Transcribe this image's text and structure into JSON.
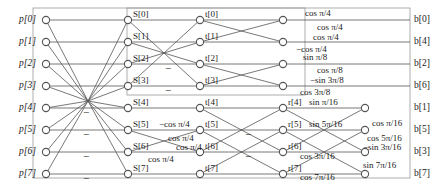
{
  "diagram": {
    "type": "signal-flow-graph",
    "stroke_color": "#555555",
    "node_fill": "#ffffff",
    "text_color": "#1a1a1a",
    "columns": [
      {
        "id": "p",
        "x": 46
      },
      {
        "id": "S",
        "x": 128
      },
      {
        "id": "t",
        "x": 200
      },
      {
        "id": "r",
        "x": 283
      },
      {
        "id": "b",
        "x": 365
      }
    ],
    "rows_y": [
      20,
      42,
      64,
      86,
      108,
      130,
      152,
      174
    ]
  },
  "inputs": {
    "labels": [
      "p[0]",
      "p[1]",
      "p[2]",
      "p[3]",
      "p[4]",
      "p[5]",
      "p[6]",
      "p[7]"
    ]
  },
  "outputs": {
    "labels": [
      "b[0]",
      "b[4]",
      "b[2]",
      "b[6]",
      "b[1]",
      "b[5]",
      "b[3]",
      "b[7]"
    ]
  },
  "stage1_nodes": {
    "labels": [
      "S[0]",
      "S[1]",
      "S[2]",
      "S[3]",
      "S[4]",
      "S[5]",
      "S[6]",
      "S[7]"
    ]
  },
  "stage2_nodes": {
    "labels": [
      "t[0]",
      "t[1]",
      "t[2]",
      "t[3]",
      "t[4]",
      "t[5]",
      "t[6]",
      "t[7]"
    ]
  },
  "stage3_nodes": {
    "labels": [
      "r[4]",
      "r[5]",
      "r[6]",
      "r[7]"
    ]
  },
  "minus_signs": [
    {
      "name": "minus-stage1-row5",
      "x": 83,
      "y": 113
    },
    {
      "name": "minus-stage1-row6",
      "x": 83,
      "y": 135
    },
    {
      "name": "minus-stage1-row7",
      "x": 83,
      "y": 157
    },
    {
      "name": "minus-stage1-row8",
      "x": 83,
      "y": 179
    },
    {
      "name": "minus-stage2-row3",
      "x": 165,
      "y": 69
    },
    {
      "name": "minus-stage2-row4",
      "x": 165,
      "y": 91
    },
    {
      "name": "minus-stage3-row6",
      "x": 245,
      "y": 135
    },
    {
      "name": "minus-stage3-row7",
      "x": 245,
      "y": 157
    },
    {
      "text": "−"
    }
  ],
  "coefficients": [
    {
      "name": "coef-cos-pi-4-a",
      "text": "cos π/4",
      "x": 305,
      "y": 14
    },
    {
      "name": "coef-cos-pi-4-b",
      "text": "cos π/4",
      "x": 317,
      "y": 28
    },
    {
      "name": "coef-cos-pi-4-c",
      "text": "cos π/4",
      "x": 313,
      "y": 38
    },
    {
      "name": "coef-neg-cos-pi-4",
      "text": "−cos π/4",
      "x": 296,
      "y": 50
    },
    {
      "name": "coef-sin-pi-8",
      "text": "sin π/8",
      "x": 303,
      "y": 58
    },
    {
      "name": "coef-cos-pi-8",
      "text": "cos π/8",
      "x": 317,
      "y": 71
    },
    {
      "name": "coef-neg-sin-3pi-8",
      "text": "−sin 3π/8",
      "x": 310,
      "y": 81
    },
    {
      "name": "coef-cos-3pi-8",
      "text": "cos 3π/8",
      "x": 300,
      "y": 93
    },
    {
      "name": "coef-neg-cos-pi-4-s2",
      "text": "−cos π/4",
      "x": 159,
      "y": 125
    },
    {
      "name": "coef-cos-pi-4-s2b",
      "text": "cos π/4",
      "x": 168,
      "y": 139
    },
    {
      "name": "coef-cos-pi-4-s2c",
      "text": "cos π/4",
      "x": 176,
      "y": 148
    },
    {
      "name": "coef-cos-pi-4-s2d",
      "text": "cos π/4",
      "x": 148,
      "y": 160
    },
    {
      "name": "coef-sin-pi-16",
      "text": "sin π/16",
      "x": 309,
      "y": 103
    },
    {
      "name": "coef-cos-pi-16",
      "text": "cos π/16",
      "x": 372,
      "y": 124
    },
    {
      "name": "coef-sin-5pi-16",
      "text": "sin 5π/16",
      "x": 309,
      "y": 125
    },
    {
      "name": "coef-cos-5pi-16",
      "text": "cos 5π/16",
      "x": 367,
      "y": 139
    },
    {
      "name": "coef-neg-sin-3pi-16",
      "text": "−sin 3π/16",
      "x": 363,
      "y": 148
    },
    {
      "name": "coef-cos-3pi-16",
      "text": "cos 3π/16",
      "x": 300,
      "y": 157
    },
    {
      "name": "coef-sin-7pi-16",
      "text": "sin 7π/16",
      "x": 363,
      "y": 166
    },
    {
      "name": "coef-cos-7pi-16",
      "text": "cos 7π/16",
      "x": 300,
      "y": 178
    }
  ],
  "boxes": {
    "outer": {
      "x": 33,
      "y": 8,
      "width": 377,
      "height": 170
    },
    "inner": {
      "x": 127,
      "y": 8,
      "width": 178,
      "height": 87
    }
  }
}
